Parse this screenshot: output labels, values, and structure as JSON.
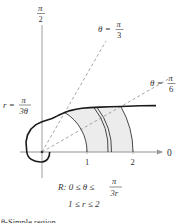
{
  "figure": {
    "axis_labels": {
      "top": "π",
      "top_den": "2",
      "right": "0"
    },
    "ticks": [
      "1",
      "2"
    ],
    "rays": [
      {
        "lhs": "θ =",
        "num": "π",
        "den": "3"
      },
      {
        "lhs": "θ =",
        "num": "π",
        "den": "6"
      }
    ],
    "curve_label": {
      "lhs": "r =",
      "num": "π",
      "den": "3θ"
    },
    "region": {
      "line1_prefix": "R: 0 ≤ θ ≤",
      "line1_num": "π",
      "line1_den": "3r",
      "line2": "1 ≤ r ≤ 2"
    },
    "caption": "θ-Simple region",
    "colors": {
      "axis": "#b5b5b5",
      "curve": "#1a1a1a",
      "shade": "#ececec",
      "dashed": "#999999",
      "text": "#333333"
    }
  }
}
